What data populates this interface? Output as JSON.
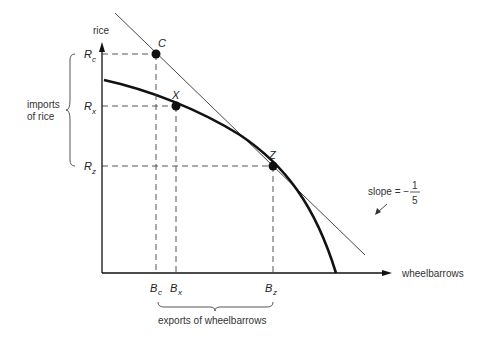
{
  "diagram": {
    "axes": {
      "y_label": "rice",
      "x_label": "wheelbarrows"
    },
    "y_ticks": [
      {
        "name": "R",
        "sub": "c",
        "y": 54
      },
      {
        "name": "R",
        "sub": "x",
        "y": 106
      },
      {
        "name": "R",
        "sub": "z",
        "y": 166
      }
    ],
    "x_ticks": [
      {
        "name": "B",
        "sub": "c",
        "x": 156
      },
      {
        "name": "B",
        "sub": "x",
        "x": 176
      },
      {
        "name": "B",
        "sub": "z",
        "x": 273
      }
    ],
    "points": [
      {
        "label": "C",
        "x": 156,
        "y": 54
      },
      {
        "label": "X",
        "x": 176,
        "y": 106
      },
      {
        "label": "Z",
        "x": 273,
        "y": 166
      }
    ],
    "brace_y_label_line1": "imports",
    "brace_y_label_line2": "of rice",
    "brace_x_label": "exports of wheelbarrows",
    "slope_label": "slope = −",
    "slope_num": "1",
    "slope_den": "5"
  }
}
